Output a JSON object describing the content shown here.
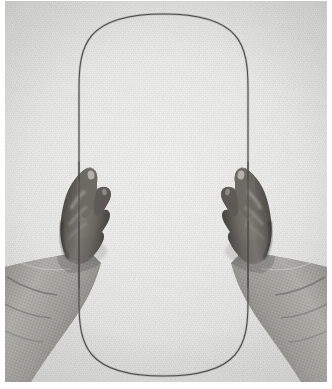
{
  "image": {
    "kind": "photograph",
    "medium": "black-and-white photograph",
    "subject": "two hands holding a thin wire bent into a tall vertical oval loop",
    "orientation": "portrait",
    "width_px": 332,
    "height_px": 389
  },
  "palette": {
    "paper_light": "#efefee",
    "paper_mid": "#e9e9e7",
    "paper_dark": "#dcdcda",
    "wire": "#4b4b4a",
    "skin_light": "#9a9691",
    "skin_mid": "#6f6a65",
    "skin_dark": "#46423e",
    "skin_shadow": "#2e2b28",
    "sleeve_light": "#b9b8b4",
    "sleeve_mid": "#9c9b96",
    "sleeve_dark": "#7a7974",
    "border": "#ffffff"
  },
  "border": {
    "left_px": 5,
    "right_px": 5,
    "top_px": 1,
    "bottom_px": 7,
    "color": "#ffffff"
  },
  "loop": {
    "name": "wire-loop",
    "shape": "stadium / elongated oval",
    "top_y": 14,
    "bottom_y": 376,
    "left_x": 79,
    "right_x": 248,
    "width_px": 169,
    "height_px": 362,
    "stroke_color": "#4b4b4a",
    "stroke_width_px": 1
  },
  "hands": [
    {
      "name": "left-hand",
      "side": "left",
      "grip_point_x": 82,
      "grip_point_y": 176,
      "description": "dark-skinned right-side-facing hand, fingers curled, thumb and index pinching the wire, knuckles toward viewer"
    },
    {
      "name": "right-hand",
      "side": "right",
      "grip_point_x": 246,
      "grip_point_y": 176,
      "description": "mirrored dark-skinned hand pinching the wire at the same height"
    }
  ],
  "sleeves": [
    {
      "name": "left-sleeve",
      "side": "left",
      "fabric": "heathered gray knit",
      "cuff_y": 252
    },
    {
      "name": "right-sleeve",
      "side": "right",
      "fabric": "heathered gray knit",
      "cuff_y": 252
    }
  ],
  "background": {
    "name": "seamless-paper-backdrop",
    "tone": "light warm gray",
    "texture": "fine photographic grain"
  }
}
